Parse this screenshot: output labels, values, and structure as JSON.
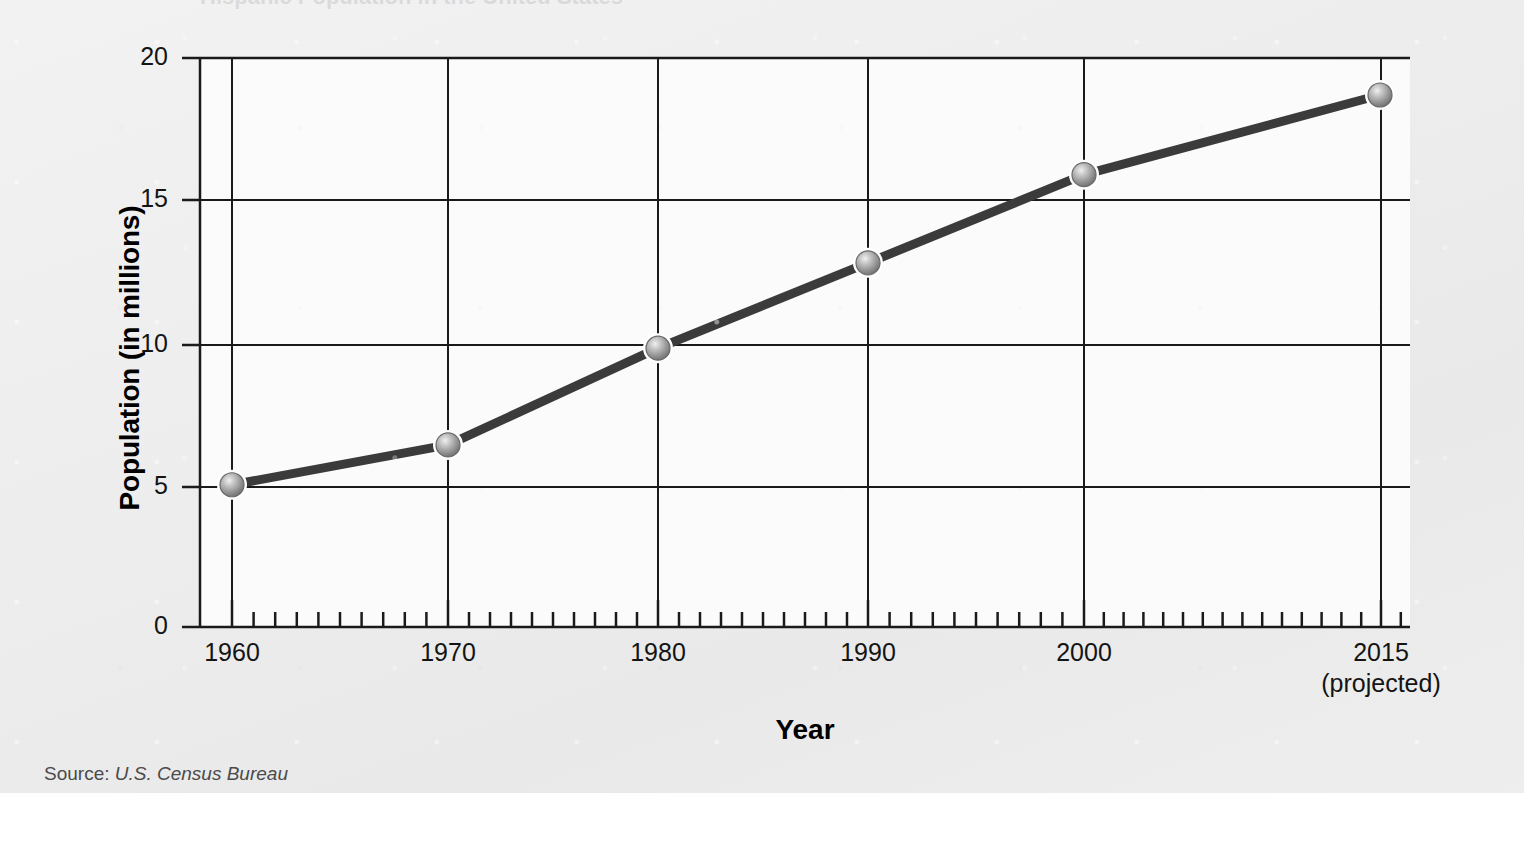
{
  "figure": {
    "title": "Hispanic Population in the United States",
    "source_prefix": "Source:",
    "source_value": "U.S. Census Bureau",
    "background_color": "#eeeeee"
  },
  "chart_data": {
    "type": "line",
    "title": "Hispanic Population in the United States",
    "xlabel": "Year",
    "ylabel": "Population (in millions)",
    "x": [
      1960,
      1970,
      1980,
      1990,
      2000,
      2015
    ],
    "values": [
      5.0,
      6.4,
      9.8,
      12.8,
      15.9,
      18.7
    ],
    "categories": [
      "1960",
      "1970",
      "1980",
      "1990",
      "2000",
      "2015"
    ],
    "xtick_labels": [
      "1960",
      "1970",
      "1980",
      "1990",
      "2000",
      "2015"
    ],
    "xtick_sublabels": [
      "",
      "",
      "",
      "",
      "",
      "(projected)"
    ],
    "ytick_labels": [
      "0",
      "5",
      "10",
      "15",
      "20"
    ],
    "ytick_values": [
      0,
      5,
      10,
      15,
      20
    ],
    "ylim": [
      0,
      20
    ],
    "xlim": [
      1958.9,
      2017.4
    ],
    "grid": true,
    "legend": "none",
    "minor_tick_interval": 1,
    "line_color": "#3b3b3b",
    "marker_color": "#9a9a9a",
    "marker_style": "sphere",
    "axis_color": "#1a1a1a"
  }
}
